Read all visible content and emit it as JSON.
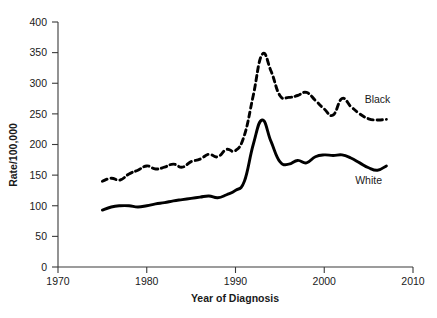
{
  "chart_data": {
    "type": "line",
    "title": "",
    "xlabel": "Year of Diagnosis",
    "ylabel": "Rate/100,000",
    "xlim": [
      1970,
      2010
    ],
    "ylim": [
      0,
      400
    ],
    "xticks": [
      1970,
      1980,
      1990,
      2000,
      2010
    ],
    "xtick_labels": [
      "1970",
      "1980",
      "1990",
      "2000",
      "2010"
    ],
    "yticks": [
      0,
      50,
      100,
      150,
      200,
      250,
      300,
      350,
      400
    ],
    "ytick_labels": [
      "0",
      "50",
      "100",
      "150",
      "200",
      "250",
      "300",
      "350",
      "400"
    ],
    "grid": false,
    "legend_position": "inline-right",
    "x": [
      1975,
      1976,
      1977,
      1978,
      1979,
      1980,
      1981,
      1982,
      1983,
      1984,
      1985,
      1986,
      1987,
      1988,
      1989,
      1990,
      1991,
      1992,
      1993,
      1994,
      1995,
      1996,
      1997,
      1998,
      1999,
      2000,
      2001,
      2002,
      2003,
      2004,
      2005,
      2006,
      2007
    ],
    "series": [
      {
        "name": "Black",
        "style": "dashed",
        "color": "#000000",
        "label_at": {
          "x": 2006,
          "y": 268
        },
        "values": [
          140,
          145,
          142,
          152,
          158,
          165,
          160,
          163,
          168,
          163,
          172,
          176,
          184,
          180,
          192,
          190,
          215,
          280,
          347,
          320,
          280,
          277,
          280,
          285,
          272,
          258,
          248,
          275,
          262,
          250,
          242,
          240,
          241
        ]
      },
      {
        "name": "White",
        "style": "solid",
        "color": "#000000",
        "label_at": {
          "x": 2005,
          "y": 135
        },
        "values": [
          93,
          98,
          100,
          100,
          98,
          100,
          103,
          105,
          108,
          110,
          112,
          114,
          116,
          113,
          118,
          125,
          140,
          200,
          240,
          205,
          172,
          168,
          174,
          170,
          180,
          183,
          182,
          183,
          178,
          170,
          162,
          158,
          165
        ]
      }
    ]
  }
}
